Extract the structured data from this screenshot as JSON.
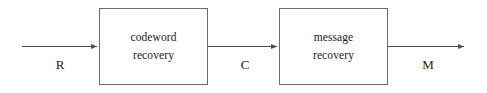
{
  "diagram": {
    "background_color": "#ffffff",
    "line_color": "#4d4d4d",
    "border_color": "#6b6b6b",
    "text_color": "#1a1a1a",
    "blocks": [
      {
        "id": "codeword-recovery",
        "line1": "codeword",
        "line2": "recovery"
      },
      {
        "id": "message-recovery",
        "line1": "message",
        "line2": "recovery"
      }
    ],
    "signals": [
      {
        "id": "input",
        "label": "R"
      },
      {
        "id": "intermediate",
        "label": "C"
      },
      {
        "id": "output",
        "label": "M"
      }
    ]
  }
}
